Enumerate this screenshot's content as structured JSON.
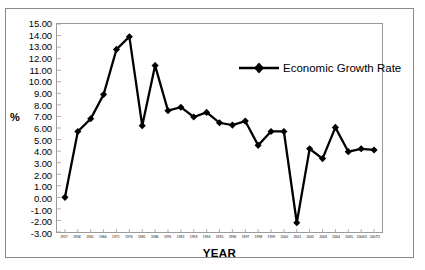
{
  "chart_data": {
    "type": "line",
    "title": "",
    "xlabel": "YEAR",
    "ylabel": "%",
    "ylim": [
      -3.0,
      15.0
    ],
    "ytick_step": 1.0,
    "grid": false,
    "legend_position": "top-right",
    "legend": [
      "Economic Growth Rate"
    ],
    "series_color": "#000000",
    "marker": "diamond",
    "categories": [
      "1957",
      "1958",
      "1961",
      "1966",
      "1971",
      "1976",
      "1981",
      "1986",
      "1991",
      "1992",
      "1993",
      "1994",
      "1995",
      "1996",
      "1997",
      "1998",
      "1999",
      "2000",
      "2001",
      "2002",
      "2003",
      "2004",
      "2005",
      "2006/1",
      "2007/1"
    ],
    "values": [
      0.0,
      5.7,
      6.8,
      8.9,
      12.8,
      13.9,
      6.2,
      11.4,
      7.5,
      7.8,
      6.95,
      7.35,
      6.45,
      6.25,
      6.6,
      4.5,
      5.7,
      5.7,
      -2.2,
      4.2,
      3.35,
      6.05,
      3.95,
      4.2,
      4.1
    ],
    "ytick_labels": [
      "15.00",
      "14.00",
      "13.00",
      "12.00",
      "11.00",
      "10.00",
      "9.00",
      "8.00",
      "7.00",
      "6.00",
      "5.00",
      "4.00",
      "3.00",
      "2.00",
      "1.00",
      "0.00",
      "-1.00",
      "-2.00",
      "-3.00"
    ],
    "ytick_values": [
      15,
      14,
      13,
      12,
      11,
      10,
      9,
      8,
      7,
      6,
      5,
      4,
      3,
      2,
      1,
      0,
      -1,
      -2,
      -3
    ]
  }
}
